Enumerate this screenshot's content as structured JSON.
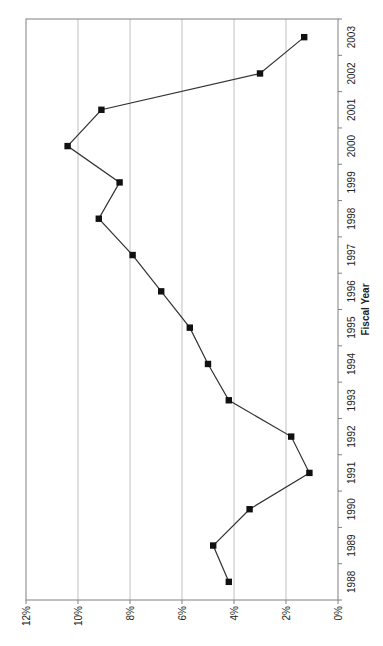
{
  "chart_data": {
    "type": "line",
    "orientation": "rotated-90",
    "title": "",
    "xlabel": "Fiscal Year",
    "ylabel": "",
    "categories": [
      "1988",
      "1989",
      "1990",
      "1991",
      "1992",
      "1993",
      "1994",
      "1995",
      "1996",
      "1997",
      "1998",
      "1999",
      "2000",
      "2001",
      "2002",
      "2003"
    ],
    "series": [
      {
        "name": "Rate",
        "marker": "square",
        "color": "#222222",
        "values": [
          4.2,
          4.8,
          3.4,
          1.1,
          1.8,
          4.2,
          5.0,
          5.7,
          6.8,
          7.9,
          9.2,
          8.4,
          10.4,
          9.1,
          3.0,
          1.3
        ]
      }
    ],
    "y_ticks": [
      "0%",
      "2%",
      "4%",
      "6%",
      "8%",
      "10%",
      "12%"
    ],
    "ylim": [
      0,
      12
    ],
    "grid": true,
    "legend": "none"
  },
  "colors": {
    "line": "#333333",
    "marker": "#111111",
    "grid": "#b0b0b0",
    "axis": "#808080",
    "background": "#ffffff"
  }
}
